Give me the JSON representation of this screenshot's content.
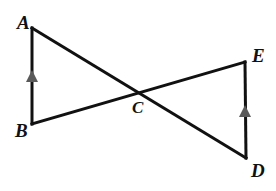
{
  "diagram": {
    "background_color": "#ffffff",
    "line_color": "#111111",
    "line_width": 3,
    "tick_color": "#5a5a5a",
    "label_color": "#111111",
    "label_font_size": 19,
    "points": {
      "A": {
        "label": "A",
        "x": 32,
        "y": 28,
        "label_x": 17,
        "label_y": 29
      },
      "B": {
        "label": "B",
        "x": 32,
        "y": 124,
        "label_x": 15,
        "label_y": 137
      },
      "C": {
        "label": "C",
        "x": 141,
        "y": 93,
        "label_x": 132,
        "label_y": 113
      },
      "D": {
        "label": "D",
        "x": 246,
        "y": 158,
        "label_x": 251,
        "label_y": 177
      },
      "E": {
        "label": "E",
        "x": 245,
        "y": 62,
        "label_x": 252,
        "label_y": 62
      }
    },
    "segments": [
      {
        "name": "segment-AB",
        "from": "A",
        "to": "B"
      },
      {
        "name": "segment-AD",
        "from": "A",
        "to": "D"
      },
      {
        "name": "segment-BE",
        "from": "B",
        "to": "E"
      },
      {
        "name": "segment-ED",
        "from": "E",
        "to": "D"
      }
    ],
    "tick_marks": [
      {
        "name": "parallel-tick-AB",
        "on_segment": "segment-AB",
        "x": 32,
        "y": 77,
        "direction": "up"
      },
      {
        "name": "parallel-tick-ED",
        "on_segment": "segment-ED",
        "x": 245,
        "y": 112,
        "direction": "up"
      }
    ]
  }
}
